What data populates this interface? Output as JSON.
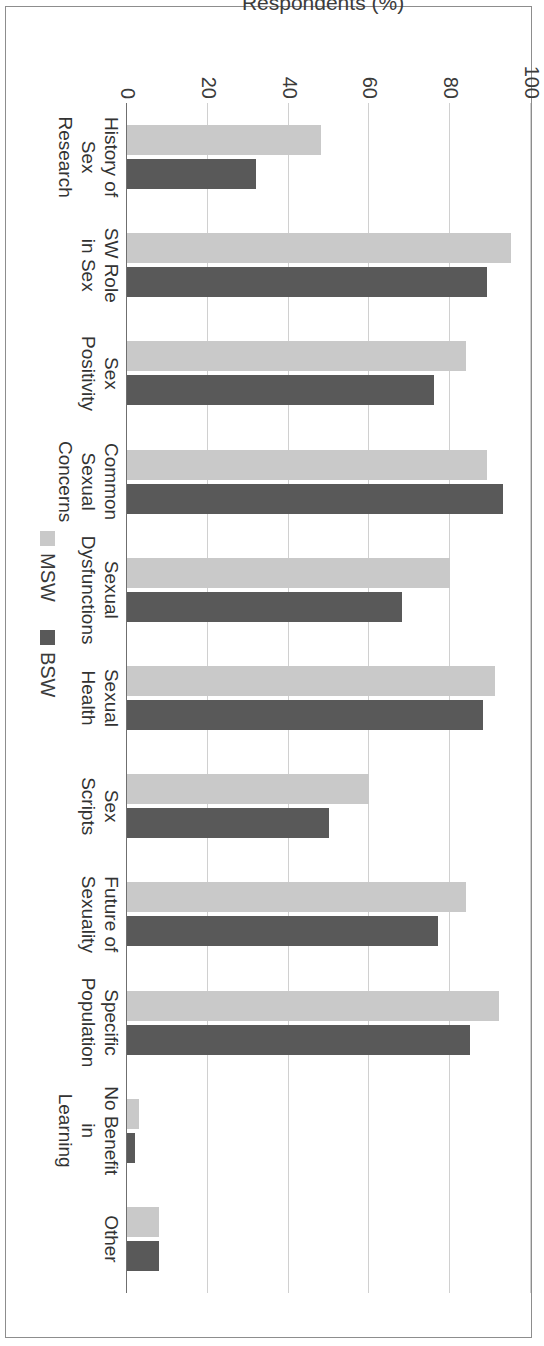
{
  "chart_data": {
    "type": "bar",
    "orientation": "vertical-rotated-90",
    "title": "",
    "xlabel": "",
    "ylabel": "Respondents (%)",
    "ylim": [
      0,
      100
    ],
    "yticks": [
      0,
      20,
      40,
      60,
      80,
      100
    ],
    "grid": true,
    "legend_position": "bottom-right",
    "categories": [
      "History of\nSex\nResearch",
      "SW Role\nin Sex",
      "Sex\nPositivity",
      "Common\nSexual\nConcerns",
      "Sexual\nDysfunctions",
      "Sexual\nHealth",
      "Sex\nScripts",
      "Future of\nSexuality",
      "Specific\nPopulation",
      "No Benefit\nin\nLearning",
      "Other"
    ],
    "series": [
      {
        "name": "MSW",
        "color": "#c9c9c9",
        "values": [
          48,
          95,
          84,
          89,
          80,
          91,
          60,
          84,
          92,
          3,
          8
        ]
      },
      {
        "name": "BSW",
        "color": "#595959",
        "values": [
          32,
          89,
          76,
          93,
          68,
          88,
          50,
          77,
          85,
          2,
          8
        ]
      }
    ]
  },
  "legend": {
    "items": [
      {
        "label": "MSW",
        "swatch": "msw"
      },
      {
        "label": "BSW",
        "swatch": "bsw"
      }
    ]
  },
  "axis": {
    "y_title": "Respondents (%)",
    "tick_labels": [
      "0",
      "20",
      "40",
      "60",
      "80",
      "100"
    ]
  }
}
